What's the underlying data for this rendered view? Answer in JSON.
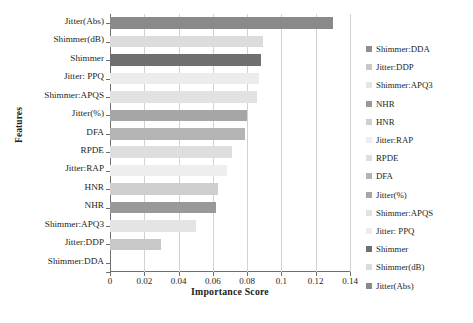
{
  "chart_data": {
    "type": "bar",
    "orientation": "horizontal",
    "title": "",
    "xlabel": "Importance Score",
    "ylabel": "Features",
    "xlim": [
      0,
      0.14
    ],
    "xticks": [
      "0",
      "0.02",
      "0.04",
      "0.06",
      "0.08",
      "0.1",
      "0.12",
      "0.14"
    ],
    "xtick_values": [
      0,
      0.02,
      0.04,
      0.06,
      0.08,
      0.1,
      0.12,
      0.14
    ],
    "grid": "vertical",
    "legend_position": "right",
    "categories": [
      "Jitter(Abs)",
      "Shimmer(dB)",
      "Shimmer",
      "Jitter: PPQ",
      "Shimmer:APQS",
      "Jitter(%)",
      "DFA",
      "RPDE",
      "Jitter:RAP",
      "HNR",
      "NHR",
      "Shimmer:APQ3",
      "Jitter:DDP",
      "Shimmer:DDA"
    ],
    "values": [
      0.13,
      0.089,
      0.088,
      0.087,
      0.086,
      0.08,
      0.079,
      0.071,
      0.068,
      0.063,
      0.062,
      0.05,
      0.03,
      0.0
    ],
    "colors": [
      "#8a8a8a",
      "#dcdcdc",
      "#6f6f6f",
      "#ececec",
      "#e2e2e2",
      "#a6a6a6",
      "#b4b4b4",
      "#dedede",
      "#eeeeee",
      "#cfcfcf",
      "#999999",
      "#e4e4e4",
      "#c8c8c8",
      "#f4f4f4"
    ],
    "legend": [
      {
        "label": "Shimmer:DDA",
        "color": "#8f8f8f"
      },
      {
        "label": "Jitter:DDP",
        "color": "#c8c8c8"
      },
      {
        "label": "Shimmer:APQ3",
        "color": "#e4e4e4"
      },
      {
        "label": "NHR",
        "color": "#999999"
      },
      {
        "label": "HNR",
        "color": "#cfcfcf"
      },
      {
        "label": "Jitter:RAP",
        "color": "#eeeeee"
      },
      {
        "label": "RPDE",
        "color": "#dedede"
      },
      {
        "label": "DFA",
        "color": "#b4b4b4"
      },
      {
        "label": "Jitter(%)",
        "color": "#a6a6a6"
      },
      {
        "label": "Shimmer:APQS",
        "color": "#e2e2e2"
      },
      {
        "label": "Jitter: PPQ",
        "color": "#ececec"
      },
      {
        "label": "Shimmer",
        "color": "#6f6f6f"
      },
      {
        "label": "Shimmer(dB)",
        "color": "#dcdcdc"
      },
      {
        "label": "Jitter(Abs)",
        "color": "#8a8a8a"
      }
    ]
  }
}
